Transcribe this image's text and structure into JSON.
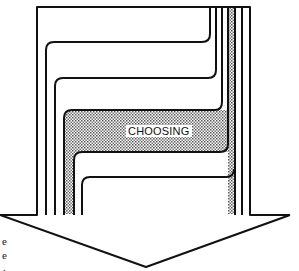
{
  "diagram": {
    "center_label": "CHOOSING",
    "left_edge_fragments": [
      "e",
      "e",
      "."
    ],
    "colors": {
      "stroke": "#111111",
      "background": "#ffffff",
      "band_fill": "#c8c8c8"
    },
    "shape": "downward arrow formed by converging nested paths"
  }
}
